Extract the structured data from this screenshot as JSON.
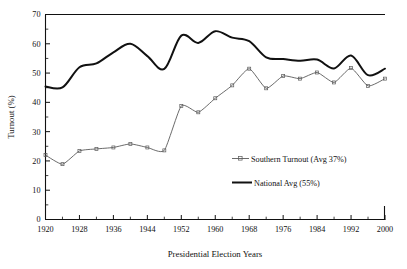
{
  "chart_data": {
    "type": "line",
    "title": "",
    "xlabel": "Presidential Election Years",
    "ylabel": "Turnout (%)",
    "xlim": [
      1920,
      2000
    ],
    "ylim": [
      0,
      70
    ],
    "ytick_step": 10,
    "yminor_step": 5,
    "xtick_step": 8,
    "xminor_step": 4,
    "grid": false,
    "legend_position": "center-right",
    "x": [
      1920,
      1924,
      1928,
      1932,
      1936,
      1940,
      1944,
      1948,
      1952,
      1956,
      1960,
      1964,
      1968,
      1972,
      1976,
      1980,
      1984,
      1988,
      1992,
      1996,
      2000
    ],
    "xticklabels": [
      "1920",
      "1928",
      "1936",
      "1944",
      "1952",
      "1960",
      "1968",
      "1976",
      "1984",
      "1992",
      "2000"
    ],
    "yticklabels": [
      "0",
      "10",
      "20",
      "30",
      "40",
      "50",
      "60",
      "70"
    ],
    "series": [
      {
        "name": "Southern Turnout (Avg 37%)",
        "average": 37,
        "color": "#5a5a5a",
        "style": "thin-marked",
        "values": [
          22.0,
          18.9,
          23.4,
          24.1,
          24.6,
          25.8,
          24.6,
          23.6,
          38.8,
          36.6,
          41.4,
          45.8,
          51.5,
          44.8,
          49.0,
          48.1,
          50.2,
          46.8,
          51.7,
          45.6,
          48.1
        ]
      },
      {
        "name": "National Avg (55%)",
        "average": 55,
        "color": "#111111",
        "style": "thick-solid",
        "values": [
          45.4,
          45.1,
          52.0,
          53.3,
          57.1,
          60.0,
          55.8,
          51.4,
          62.8,
          60.3,
          64.3,
          62.1,
          60.9,
          55.4,
          54.8,
          54.2,
          54.6,
          51.6,
          56.0,
          49.3,
          51.5
        ]
      }
    ],
    "legend": [
      {
        "label": "Southern Turnout (Avg 37%)",
        "marker": "line-with-markers",
        "color": "#5a5a5a"
      },
      {
        "label": "National Avg (55%)",
        "marker": "thick-line",
        "color": "#111111"
      }
    ]
  }
}
